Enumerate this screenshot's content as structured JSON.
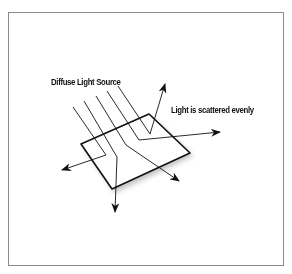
{
  "figure": {
    "labels": {
      "source": "Diffuse Light Source",
      "scatter": "Light is scattered evenly"
    },
    "colors": {
      "stroke": "#111111",
      "frame": "#8a8a8a",
      "shadow": "#bbbbbb"
    }
  }
}
